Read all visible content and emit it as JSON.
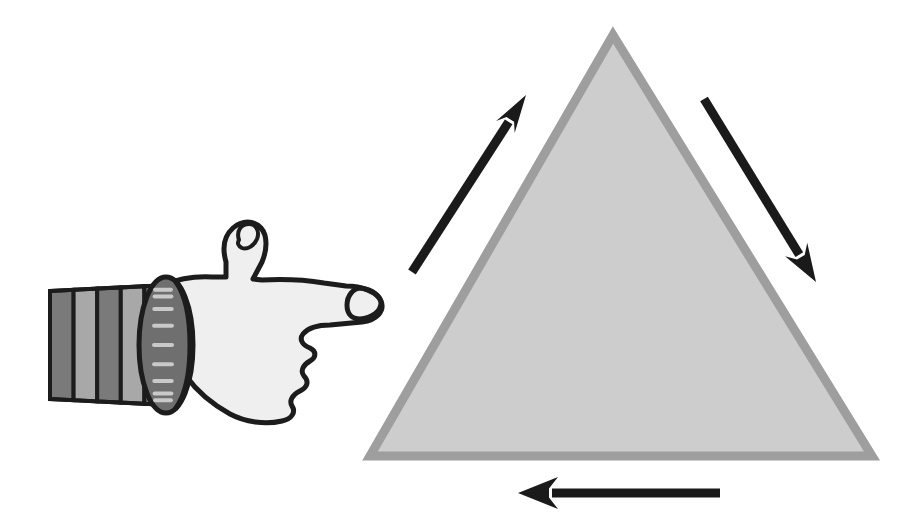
{
  "canvas": {
    "width": 915,
    "height": 525,
    "background_color": "#FFFFFF",
    "title": "Pointing hand and triangle traversal diagram"
  },
  "palette": {
    "background": "#FFFFFF",
    "arrow_black": "#1A1A1A",
    "outline_black": "#1C1C1C",
    "triangle_fill": "#CDCDCD",
    "triangle_border": "#9E9E9E",
    "hand_fill": "#EFEFEF",
    "cuff_fill": "#6F6F6F",
    "cuff_tick": "#C9C9C9",
    "sleeve_dark": "#7A7A7A",
    "sleeve_light": "#A8A8A8"
  },
  "shapes": {
    "triangle": {
      "label": "triangle",
      "apex": [
        613,
        35
      ],
      "bottom_left": [
        370,
        456
      ],
      "bottom_right": [
        872,
        456
      ],
      "fill": "#CDCDCD",
      "border_color": "#9E9E9E",
      "border_width": 9
    },
    "hand": {
      "label": "pointing-hand",
      "direction": "right",
      "fill": "#EFEFEF",
      "outline": "#1C1C1C",
      "outline_width": 5,
      "fingertip": [
        378,
        303
      ],
      "thumb_tip": [
        258,
        230
      ]
    },
    "cuff": {
      "label": "wristband-cuff",
      "center": [
        166,
        345
      ],
      "radius_x": 27,
      "radius_y": 68,
      "fill": "#6F6F6F",
      "tick_color": "#C9C9C9",
      "tick_count": 9
    },
    "sleeve": {
      "label": "striped-sleeve",
      "left": 50,
      "right": 168,
      "stripe_count": 5,
      "colors": [
        "#7A7A7A",
        "#A8A8A8"
      ]
    }
  },
  "arrows": [
    {
      "name": "left-side-arrow",
      "description": "upward arrow along left edge of triangle",
      "direction": "up-right",
      "tail": [
        412,
        272
      ],
      "tip": [
        526,
        95
      ],
      "color": "#1A1A1A",
      "thickness": 9,
      "head_length": 38,
      "head_half_width": 11
    },
    {
      "name": "right-side-arrow",
      "description": "downward arrow along right edge of triangle",
      "direction": "down-right",
      "tail": [
        704,
        99
      ],
      "tip": [
        816,
        282
      ],
      "color": "#1A1A1A",
      "thickness": 9,
      "head_length": 38,
      "head_half_width": 13
    },
    {
      "name": "bottom-arrow",
      "description": "leftward arrow beneath the triangle base",
      "direction": "left",
      "tail": [
        720,
        493
      ],
      "tip": [
        518,
        493
      ],
      "color": "#1A1A1A",
      "thickness": 9,
      "head_length": 40,
      "head_half_width": 16
    }
  ]
}
